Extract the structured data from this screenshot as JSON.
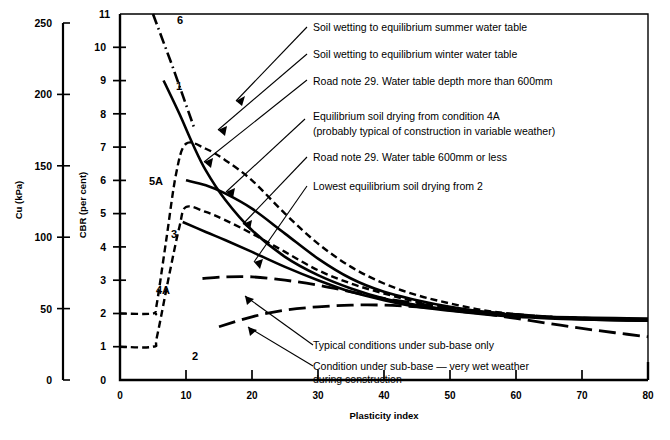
{
  "chart_data": {
    "type": "line",
    "title": "",
    "xlabel": "Plasticity index",
    "ylabel": "CBR (per cent)",
    "secondary_ylabel": "Cu (kPa)",
    "xlim": [
      0,
      80
    ],
    "ylim": [
      0,
      11
    ],
    "secondary_ylim": [
      0,
      250
    ],
    "grid": false,
    "legend_position": "inline-annotations",
    "xticks": [
      "0",
      "10",
      "20",
      "30",
      "40",
      "50",
      "60",
      "70",
      "80"
    ],
    "xtick_values": [
      0,
      10,
      20,
      30,
      40,
      50,
      60,
      70,
      80
    ],
    "yticks": [
      "0",
      "1",
      "2",
      "3",
      "4",
      "5",
      "6",
      "7",
      "8",
      "9",
      "10",
      "11"
    ],
    "ytick_values": [
      0,
      1,
      2,
      3,
      4,
      5,
      6,
      7,
      8,
      9,
      10,
      11
    ],
    "secondary_yticks": [
      "0",
      "50",
      "100",
      "150",
      "200",
      "250"
    ],
    "secondary_ytick_values": [
      0,
      50,
      100,
      150,
      200,
      250
    ],
    "series": [
      {
        "name": "6",
        "label": "6",
        "style": "dash-dot",
        "color": "#000000",
        "description": "Soil wetting to equilibrium summer water table",
        "points": [
          [
            5.0,
            11.0
          ],
          [
            6.5,
            10.2
          ],
          [
            8.0,
            9.4
          ],
          [
            9.6,
            8.5
          ],
          [
            11.2,
            7.6
          ]
        ]
      },
      {
        "name": "1",
        "label": "1",
        "style": "solid",
        "color": "#000000",
        "description": "Road note 29. Water table depth more than 600mm",
        "points": [
          [
            6.6,
            9.0
          ],
          [
            9,
            8.0
          ],
          [
            11,
            7.1
          ],
          [
            13,
            6.3
          ],
          [
            16,
            5.4
          ],
          [
            20,
            4.5
          ],
          [
            25,
            3.7
          ],
          [
            30,
            3.15
          ],
          [
            35,
            2.75
          ],
          [
            40,
            2.45
          ],
          [
            45,
            2.25
          ],
          [
            50,
            2.1
          ],
          [
            55,
            2.0
          ],
          [
            60,
            1.95
          ],
          [
            65,
            1.9
          ],
          [
            70,
            1.88
          ],
          [
            75,
            1.86
          ],
          [
            80,
            1.85
          ]
        ]
      },
      {
        "name": "5A",
        "label": "5A",
        "style": "solid",
        "color": "#000000",
        "description": "Soil wetting to equilibrium winter water table",
        "points": [
          [
            10,
            6.0
          ],
          [
            13,
            5.85
          ],
          [
            16,
            5.6
          ],
          [
            20,
            5.15
          ],
          [
            25,
            4.4
          ],
          [
            30,
            3.65
          ],
          [
            35,
            3.05
          ],
          [
            40,
            2.65
          ],
          [
            45,
            2.4
          ],
          [
            50,
            2.2
          ],
          [
            55,
            2.05
          ],
          [
            60,
            1.95
          ],
          [
            65,
            1.88
          ],
          [
            70,
            1.83
          ],
          [
            75,
            1.8
          ],
          [
            80,
            1.78
          ]
        ]
      },
      {
        "name": "upper-dashed",
        "label": "",
        "style": "dashed",
        "color": "#000000",
        "description": "Equilibrium soil drying from condition 4A (probably typical of construction in variable weather)",
        "points": [
          [
            0,
            2.0
          ],
          [
            5,
            2.0
          ],
          [
            5.5,
            2.2
          ],
          [
            7,
            4.2
          ],
          [
            8.5,
            6.2
          ],
          [
            10,
            7.1
          ],
          [
            13,
            6.95
          ],
          [
            16,
            6.6
          ],
          [
            20,
            6.0
          ],
          [
            25,
            5.0
          ],
          [
            30,
            4.1
          ],
          [
            35,
            3.4
          ],
          [
            40,
            2.9
          ],
          [
            45,
            2.55
          ],
          [
            50,
            2.3
          ],
          [
            55,
            2.1
          ],
          [
            60,
            1.98
          ],
          [
            65,
            1.9
          ],
          [
            70,
            1.85
          ],
          [
            75,
            1.82
          ],
          [
            80,
            1.8
          ]
        ]
      },
      {
        "name": "3",
        "label": "3",
        "style": "solid",
        "color": "#000000",
        "description": "Road note 29. Water table 600mm or less",
        "points": [
          [
            9.5,
            4.75
          ],
          [
            13,
            4.45
          ],
          [
            16,
            4.2
          ],
          [
            20,
            3.85
          ],
          [
            25,
            3.4
          ],
          [
            30,
            3.0
          ],
          [
            35,
            2.65
          ],
          [
            40,
            2.4
          ],
          [
            45,
            2.2
          ],
          [
            50,
            2.08
          ],
          [
            55,
            1.98
          ],
          [
            60,
            1.9
          ],
          [
            65,
            1.85
          ],
          [
            70,
            1.82
          ],
          [
            75,
            1.8
          ],
          [
            80,
            1.78
          ]
        ]
      },
      {
        "name": "lower-dashed",
        "label": "",
        "style": "dashed",
        "color": "#000000",
        "description": "Lowest equilibrium soil drying from 2",
        "points": [
          [
            0,
            1.0
          ],
          [
            5,
            1.0
          ],
          [
            5.6,
            1.3
          ],
          [
            7.5,
            3.2
          ],
          [
            9,
            4.6
          ],
          [
            10,
            5.2
          ],
          [
            13,
            5.05
          ],
          [
            16,
            4.8
          ],
          [
            20,
            4.4
          ],
          [
            25,
            3.85
          ],
          [
            30,
            3.3
          ],
          [
            35,
            2.9
          ],
          [
            40,
            2.6
          ],
          [
            45,
            2.35
          ],
          [
            50,
            2.18
          ],
          [
            55,
            2.05
          ],
          [
            60,
            1.95
          ],
          [
            65,
            1.88
          ],
          [
            70,
            1.84
          ],
          [
            75,
            1.81
          ],
          [
            80,
            1.8
          ]
        ]
      },
      {
        "name": "4A",
        "label": "4A",
        "style": "long-dash",
        "color": "#000000",
        "description": "Typical conditions under sub-base only",
        "points": [
          [
            12.5,
            3.05
          ],
          [
            16,
            3.1
          ],
          [
            20,
            3.1
          ],
          [
            25,
            3.0
          ],
          [
            30,
            2.85
          ],
          [
            35,
            2.65
          ],
          [
            40,
            2.45
          ],
          [
            45,
            2.3
          ],
          [
            50,
            2.15
          ],
          [
            55,
            2.05
          ],
          [
            60,
            1.97
          ],
          [
            65,
            1.9
          ],
          [
            70,
            1.86
          ],
          [
            75,
            1.83
          ],
          [
            80,
            1.8
          ]
        ]
      },
      {
        "name": "2",
        "label": "2",
        "style": "long-dash",
        "color": "#000000",
        "description": "Condition under sub-base — very wet weather during construction",
        "points": [
          [
            15,
            1.6
          ],
          [
            20,
            1.9
          ],
          [
            25,
            2.1
          ],
          [
            30,
            2.2
          ],
          [
            35,
            2.25
          ],
          [
            40,
            2.25
          ],
          [
            45,
            2.2
          ],
          [
            50,
            2.12
          ],
          [
            55,
            2.0
          ],
          [
            60,
            1.85
          ],
          [
            65,
            1.7
          ],
          [
            70,
            1.55
          ],
          [
            75,
            1.42
          ],
          [
            80,
            1.3
          ]
        ]
      }
    ],
    "annotations": [
      {
        "id": "ann1",
        "text": "Soil wetting to equilibrium summer water table"
      },
      {
        "id": "ann2",
        "text": "Soil wetting to equilibrium winter water table"
      },
      {
        "id": "ann3",
        "text": "Road note 29.  Water table depth more than 600mm"
      },
      {
        "id": "ann4a",
        "text": "Equilibrium soil drying from condition 4A"
      },
      {
        "id": "ann4b",
        "text": "(probably typical of construction in variable weather)"
      },
      {
        "id": "ann5",
        "text": "Road note 29.  Water table 600mm or less"
      },
      {
        "id": "ann6",
        "text": "Lowest equilibrium soil drying from 2"
      },
      {
        "id": "ann7",
        "text": "Typical conditions under sub-base only"
      },
      {
        "id": "ann8a",
        "text": "Condition under sub-base — very wet weather"
      },
      {
        "id": "ann8b",
        "text": "during construction"
      }
    ],
    "curve_labels": [
      {
        "id": "lab6",
        "text": "6"
      },
      {
        "id": "lab1",
        "text": "1"
      },
      {
        "id": "lab5A",
        "text": "5A"
      },
      {
        "id": "lab3",
        "text": "3"
      },
      {
        "id": "lab4A",
        "text": "4A"
      },
      {
        "id": "lab2",
        "text": "2"
      }
    ]
  }
}
